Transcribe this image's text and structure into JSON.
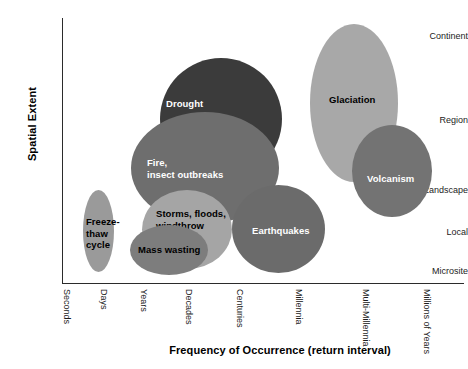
{
  "chart_data": {
    "type": "scatter",
    "title": "",
    "xlabel": "Frequency of Occurrence (return interval)",
    "ylabel": "Spatial Extent",
    "grid": false,
    "legend": "none",
    "x_tick_labels": [
      "Seconds",
      "Days",
      "Years",
      "Decades",
      "Centuries",
      "Millennia",
      "Multi-Millennia",
      "Millions of Years"
    ],
    "y_tick_labels": [
      "Continent",
      "Region",
      "Landscape",
      "Local",
      "Microsite"
    ],
    "note": "Each datum is an ellipse (bubble) spanning a range of return interval and spatial extent for a disturbance type.",
    "items": [
      {
        "label": "Freeze-\nthaw\ncycle",
        "label_plain": "Freeze-thaw cycle",
        "x_range": [
          "Days",
          "Days"
        ],
        "y_range": [
          "Microsite",
          "Local"
        ],
        "fill": "#9a9a9a",
        "text_color": "#000000"
      },
      {
        "label": "Mass wasting",
        "label_plain": "Mass wasting",
        "x_range": [
          "Years",
          "Decades"
        ],
        "y_range": [
          "Microsite",
          "Local"
        ],
        "fill": "#7d7d7d",
        "text_color": "#000000"
      },
      {
        "label": "Storms, floods,\nwindthrow",
        "label_plain": "Storms, floods, windthrow",
        "x_range": [
          "Years",
          "Decades"
        ],
        "y_range": [
          "Microsite",
          "Landscape"
        ],
        "fill": "#a5a5a5",
        "text_color": "#000000"
      },
      {
        "label": "Fire,\ninsect outbreaks",
        "label_plain": "Fire, insect outbreaks",
        "x_range": [
          "Years",
          "Centuries"
        ],
        "y_range": [
          "Local",
          "Region"
        ],
        "fill": "#6e6e6e",
        "text_color": "#ffffff"
      },
      {
        "label": "Drought",
        "label_plain": "Drought",
        "x_range": [
          "Decades",
          "Centuries"
        ],
        "y_range": [
          "Region",
          "Continent"
        ],
        "fill": "#3b3b3b",
        "text_color": "#ffffff"
      },
      {
        "label": "Earthquakes",
        "label_plain": "Earthquakes",
        "x_range": [
          "Centuries",
          "Millennia"
        ],
        "y_range": [
          "Microsite",
          "Landscape"
        ],
        "fill": "#6b6b6b",
        "text_color": "#ffffff"
      },
      {
        "label": "Glaciation",
        "label_plain": "Glaciation",
        "x_range": [
          "Millennia",
          "Multi-Millennia"
        ],
        "y_range": [
          "Landscape",
          "Continent"
        ],
        "fill": "#a8a8a8",
        "text_color": "#000000"
      },
      {
        "label": "Volcanism",
        "label_plain": "Volcanism",
        "x_range": [
          "Multi-Millennia",
          "Millions of Years"
        ],
        "y_range": [
          "Landscape",
          "Region"
        ],
        "fill": "#737373",
        "text_color": "#ffffff"
      }
    ]
  },
  "axes": {
    "y_title": "Spatial Extent",
    "x_title": "Frequency of Occurrence (return interval)",
    "y_ticks": [
      {
        "label": "Continent",
        "top": 36
      },
      {
        "label": "Region",
        "top": 120
      },
      {
        "label": "Landscape",
        "top": 190
      },
      {
        "label": "Local",
        "top": 232
      },
      {
        "label": "Microsite",
        "top": 271
      }
    ],
    "x_ticks": [
      {
        "label": "Seconds",
        "left": 72
      },
      {
        "label": "Days",
        "left": 109
      },
      {
        "label": "Years",
        "left": 149
      },
      {
        "label": "Decades",
        "left": 194
      },
      {
        "label": "Centuries",
        "left": 245
      },
      {
        "label": "Millennia",
        "left": 304
      },
      {
        "label": "Multi-Millennia",
        "left": 371
      },
      {
        "label": "Millions of Years",
        "left": 432
      }
    ]
  },
  "ellipses": [
    {
      "name": "drought",
      "label": "Drought",
      "left": 97,
      "top": 40,
      "width": 122,
      "height": 122,
      "fill": "#3b3b3b",
      "label_left": 103,
      "label_top": 80,
      "label_class": "label-light",
      "lines": [
        "Drought"
      ]
    },
    {
      "name": "glaciation",
      "label": "Glaciation",
      "left": 247,
      "top": 6,
      "width": 88,
      "height": 158,
      "fill": "#a8a8a8",
      "label_left": 266,
      "label_top": 76,
      "label_class": "label-dark",
      "lines": [
        "Glaciation"
      ]
    },
    {
      "name": "volcanism",
      "label": "Volcanism",
      "left": 289,
      "top": 107,
      "width": 80,
      "height": 92,
      "fill": "#737373",
      "label_left": 304,
      "label_top": 155,
      "label_class": "label-light",
      "lines": [
        "Volcanism"
      ]
    },
    {
      "name": "fire-insect-outbreaks",
      "label": "Fire, insect outbreaks",
      "left": 68,
      "top": 94,
      "width": 148,
      "height": 112,
      "fill": "#6e6e6e",
      "label_left": 84,
      "label_top": 139,
      "label_class": "label-light",
      "lines": [
        "Fire,",
        "insect outbreaks"
      ]
    },
    {
      "name": "earthquakes",
      "label": "Earthquakes",
      "left": 169,
      "top": 167,
      "width": 93,
      "height": 88,
      "fill": "#6b6b6b",
      "label_left": 189,
      "label_top": 207,
      "label_class": "label-light",
      "lines": [
        "Earthquakes"
      ]
    },
    {
      "name": "storms-floods-windthrow",
      "label": "Storms, floods, windthrow",
      "left": 79,
      "top": 172,
      "width": 90,
      "height": 79,
      "fill": "#a5a5a5",
      "label_left": 93,
      "label_top": 190,
      "label_class": "label-dark",
      "lines": [
        "Storms, floods,",
        "windthrow"
      ]
    },
    {
      "name": "mass-wasting",
      "label": "Mass wasting",
      "left": 67,
      "top": 207,
      "width": 78,
      "height": 50,
      "fill": "#7d7d7d",
      "label_left": 75,
      "label_top": 226,
      "label_class": "label-dark",
      "lines": [
        "Mass wasting"
      ]
    },
    {
      "name": "freeze-thaw-cycle",
      "label": "Freeze-thaw cycle",
      "left": 20,
      "top": 172,
      "width": 31,
      "height": 82,
      "fill": "#9a9a9a",
      "label_left": 23,
      "label_top": 198,
      "label_class": "label-dark",
      "lines": [
        "Freeze-",
        "thaw",
        "cycle"
      ]
    }
  ]
}
